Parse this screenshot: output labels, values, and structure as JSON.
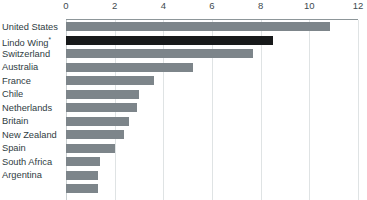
{
  "chart_data": {
    "type": "bar",
    "orientation": "horizontal",
    "title": "",
    "subtitle": "",
    "xlabel": "",
    "ylabel": "",
    "xlim": [
      0,
      12
    ],
    "xticks": [
      0,
      2,
      4,
      6,
      8,
      10,
      12
    ],
    "xtick_labels": [
      "0",
      "2",
      "4",
      "6",
      "8",
      "10",
      "12"
    ],
    "grid": true,
    "grid_axis": "x",
    "axis_position": "top",
    "legend": "none",
    "categories": [
      "United States",
      "Lindo Wing",
      "Switzerland",
      "Australia",
      "France",
      "Chile",
      "Netherlands",
      "Britain",
      "New Zealand",
      "Spain",
      "South Africa",
      "Argentina",
      ""
    ],
    "values": [
      10.85,
      8.5,
      7.7,
      5.2,
      3.6,
      3.0,
      2.9,
      2.6,
      2.4,
      2.0,
      1.4,
      1.3,
      1.3
    ],
    "highlight_index": 1,
    "highlight_label_marker": "*",
    "colors": {
      "bar": "#7d858a",
      "bar_highlight": "#17191a",
      "gridline": "#dfe3e4",
      "axis_line": "#8d9699",
      "tick_text": "#3e4a4f",
      "category_text": "#2f3c42",
      "background": "#ffffff"
    }
  }
}
